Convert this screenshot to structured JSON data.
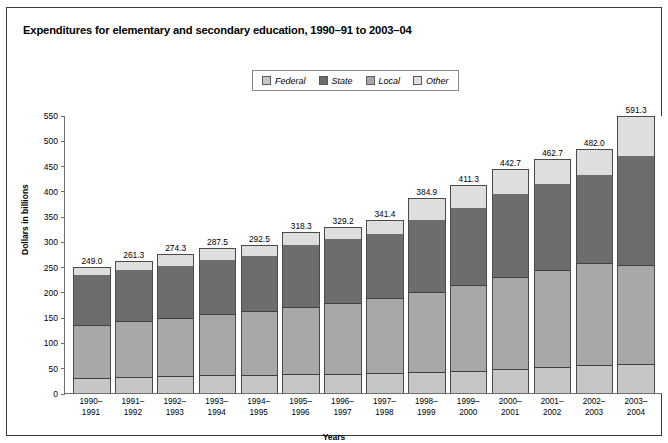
{
  "chart_title": "Expenditures for elementary and secondary education, 1990–91 to 2003–04",
  "legend": {
    "items": [
      {
        "label": "Federal",
        "color": "#c6c6c6",
        "key": "federal"
      },
      {
        "label": "State",
        "color": "#6d6d6d",
        "key": "state"
      },
      {
        "label": "Local",
        "color": "#a8a8a8",
        "key": "local"
      },
      {
        "label": "Other",
        "color": "#dedede",
        "key": "other"
      }
    ]
  },
  "axes": {
    "ylabel": "Dollars in billions",
    "xlabel": "Years",
    "yticks": [
      0,
      50,
      100,
      150,
      200,
      250,
      300,
      350,
      400,
      450,
      500,
      550
    ]
  },
  "chart_data": {
    "type": "bar",
    "title": "Expenditures for elementary and secondary education, 1990–91 to 2003–04",
    "subtype": "stacked",
    "xlabel": "Years",
    "ylabel": "Dollars in billions",
    "ylim": [
      0,
      550
    ],
    "ytick_step": 50,
    "grid": false,
    "legend_position": "top-center",
    "categories": [
      "1990–1991",
      "1991–1992",
      "1992–1993",
      "1993–1994",
      "1994–1995",
      "1995–1996",
      "1996–1997",
      "1997–1998",
      "1998–1999",
      "1999–2000",
      "2000–2001",
      "2001–2002",
      "2002–2003",
      "2003–2004"
    ],
    "category_lines": [
      [
        "1990–",
        "1991"
      ],
      [
        "1991–",
        "1992"
      ],
      [
        "1992–",
        "1993"
      ],
      [
        "1993–",
        "1994"
      ],
      [
        "1994–",
        "1995"
      ],
      [
        "1995–",
        "1996"
      ],
      [
        "1996–",
        "1997"
      ],
      [
        "1997–",
        "1998"
      ],
      [
        "1998–",
        "1999"
      ],
      [
        "1999–",
        "2000"
      ],
      [
        "2000–",
        "2001"
      ],
      [
        "2001–",
        "2002"
      ],
      [
        "2002–",
        "2003"
      ],
      [
        "2003–",
        "2004"
      ]
    ],
    "series": [
      {
        "name": "Federal",
        "color": "#c6c6c6",
        "values": [
          27.0,
          29.0,
          31.0,
          33.0,
          34.0,
          35.0,
          36.0,
          38.0,
          40.0,
          42.0,
          45.0,
          49.0,
          54.0,
          60.0
        ]
      },
      {
        "name": "Local",
        "color": "#a8a8a8",
        "values": [
          107.0,
          113.0,
          117.0,
          122.0,
          127.0,
          134.0,
          141.0,
          149.0,
          159.0,
          171.0,
          184.0,
          193.0,
          203.0,
          213.0
        ]
      },
      {
        "name": "State",
        "color": "#6d6d6d",
        "values": [
          101.0,
          103.0,
          106.0,
          110.0,
          112.0,
          126.0,
          129.0,
          130.0,
          146.0,
          155.0,
          166.0,
          173.0,
          177.0,
          235.0
        ]
      },
      {
        "name": "Other",
        "color": "#dedede",
        "values": [
          14.0,
          16.3,
          20.3,
          22.5,
          19.5,
          23.3,
          23.2,
          24.4,
          39.9,
          43.3,
          47.7,
          47.7,
          48.0,
          83.3
        ]
      }
    ],
    "totals": [
      249.0,
      261.3,
      274.3,
      287.5,
      292.5,
      318.3,
      329.2,
      341.4,
      384.9,
      411.3,
      442.7,
      462.7,
      482.0,
      591.3
    ],
    "total_labels": [
      "249.0",
      "261.3",
      "274.3",
      "287.5",
      "292.5",
      "318.3",
      "329.2",
      "341.4",
      "384.9",
      "411.3",
      "442.7",
      "462.7",
      "482.0",
      "591.3"
    ]
  }
}
